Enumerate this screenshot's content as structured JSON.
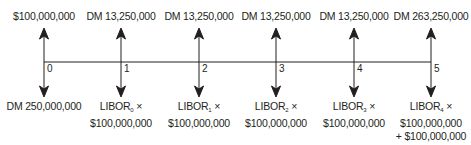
{
  "timeline": {
    "periods": [
      {
        "t": "0",
        "inflow": "$100,000,000",
        "outflow_line1": "DM 250,000,000",
        "outflow_sub": "",
        "outflow_line2": "",
        "outflow_line3": ""
      },
      {
        "t": "1",
        "inflow": "DM 13,250,000",
        "outflow_line1": "LIBOR",
        "outflow_sub": "0",
        "outflow_line2": "$100,000,000",
        "outflow_line3": ""
      },
      {
        "t": "2",
        "inflow": "DM 13,250,000",
        "outflow_line1": "LIBOR",
        "outflow_sub": "1",
        "outflow_line2": "$100,000,000",
        "outflow_line3": ""
      },
      {
        "t": "3",
        "inflow": "DM 13,250,000",
        "outflow_line1": "LIBOR",
        "outflow_sub": "2",
        "outflow_line2": "$100,000,000",
        "outflow_line3": ""
      },
      {
        "t": "4",
        "inflow": "DM 13,250,000",
        "outflow_line1": "LIBOR",
        "outflow_sub": "3",
        "outflow_line2": "$100,000,000",
        "outflow_line3": ""
      },
      {
        "t": "5",
        "inflow": "DM 263,250,000",
        "outflow_line1": "LIBOR",
        "outflow_sub": "4",
        "outflow_line2": "$100,000,000",
        "outflow_line3": "+ $100,000,000"
      }
    ],
    "times_symbol": "×"
  }
}
